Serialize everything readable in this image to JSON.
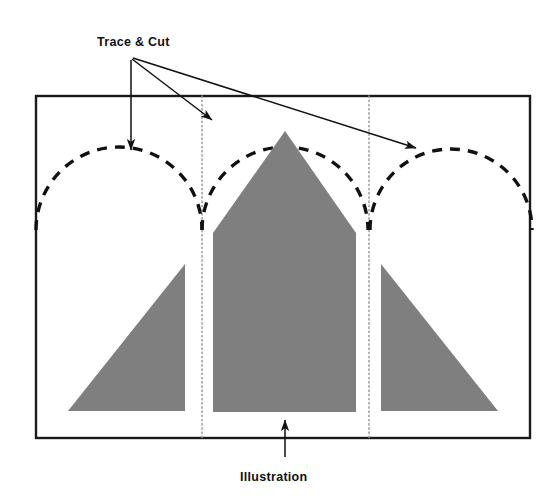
{
  "diagram": {
    "type": "technical-craft-diagram",
    "colors": {
      "background": "#ffffff",
      "frame_stroke": "#1a1a1a",
      "shape_fill": "#7f7f7f",
      "dashed_arc_stroke": "#111111",
      "dotted_fold_stroke": "#9a9a9a",
      "arrow_stroke": "#111111",
      "label_text": "#111111"
    },
    "labels": {
      "trace_and_cut": "Trace & Cut",
      "illustration": "Illustration"
    },
    "frame": {
      "x": 36,
      "y": 96,
      "width": 494,
      "height": 342,
      "stroke_width": 2.4
    },
    "fold_lines": [
      {
        "name": "left-fold-line",
        "x": 202,
        "y1": 96,
        "y2": 438
      },
      {
        "name": "right-fold-line",
        "x": 369,
        "y1": 96,
        "y2": 438
      }
    ],
    "arcs": [
      {
        "name": "left-arc",
        "cx": 119,
        "cy": 230,
        "r": 83
      },
      {
        "name": "center-arc",
        "cx": 285,
        "cy": 230,
        "r": 83
      },
      {
        "name": "right-arc",
        "cx": 451,
        "cy": 230,
        "r": 81
      }
    ],
    "shapes": [
      {
        "name": "left-triangle",
        "points": "68,411 185,411 185,264"
      },
      {
        "name": "center-pentagon",
        "points": "213,412 213,233 285,131 356,233 356,412"
      },
      {
        "name": "right-triangle",
        "points": "498,411 381,411 381,264"
      }
    ],
    "arrows": [
      {
        "name": "arrow-to-left-arc",
        "path": "M 131,60 L 131,151",
        "tip": [
          131,
          158
        ]
      },
      {
        "name": "arrow-to-center-arc",
        "path": "M 132,59 L 213,121",
        "tip": [
          219,
          125
        ]
      },
      {
        "name": "arrow-to-right-arc",
        "path": "M 133,58 L 417,149",
        "tip": [
          424,
          152
        ]
      },
      {
        "name": "arrow-to-illustration",
        "path": "M 285,457 L 285,419",
        "tip": [
          285,
          412
        ]
      }
    ],
    "label_positions": {
      "trace_and_cut": {
        "x": 97,
        "y": 46
      },
      "illustration": {
        "x": 240,
        "y": 481
      }
    }
  }
}
